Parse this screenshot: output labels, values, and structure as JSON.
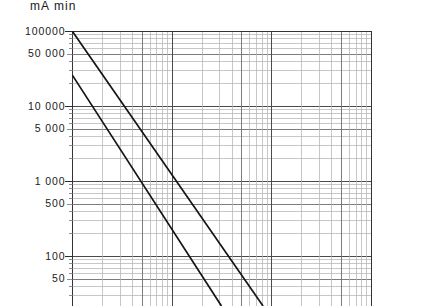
{
  "chart_data": {
    "type": "line",
    "title": "mA min",
    "xlabel": "",
    "ylabel": "mA min",
    "scale": {
      "x": "log",
      "y": "log"
    },
    "grid": "log-log graph paper, minor decade subdivisions on both axes",
    "legend": "none",
    "ylim": [
      30,
      100000
    ],
    "y_tick_labels": [
      {
        "value": 100000,
        "label": "100000"
      },
      {
        "value": 50000,
        "label": "50 000"
      },
      {
        "value": 10000,
        "label": "10 000"
      },
      {
        "value": 5000,
        "label": "5 000"
      },
      {
        "value": 1000,
        "label": "1 000"
      },
      {
        "value": 500,
        "label": "500"
      },
      {
        "value": 100,
        "label": "100"
      },
      {
        "value": 50,
        "label": "50"
      }
    ],
    "x_decades": 3,
    "series": [
      {
        "name": "upper-line",
        "note": "straight descending line on log-log axes, starts at top-left corner",
        "points": [
          [
            1,
            100000
          ],
          [
            56,
            45
          ]
        ]
      },
      {
        "name": "lower-line",
        "note": "straight descending line parallel to upper line, offset left/down",
        "points": [
          [
            1,
            26000
          ],
          [
            22,
            45
          ]
        ]
      }
    ],
    "axis_lines": {
      "left": true,
      "top": true,
      "right": true,
      "bottom": "cropped"
    },
    "colors": {
      "grid_major": "#4a4a4a",
      "grid_minor": "#b4b4b4",
      "data_line": "#141414",
      "axis": "#333333",
      "text": "#1b1b1b",
      "background": "#ffffff"
    }
  }
}
